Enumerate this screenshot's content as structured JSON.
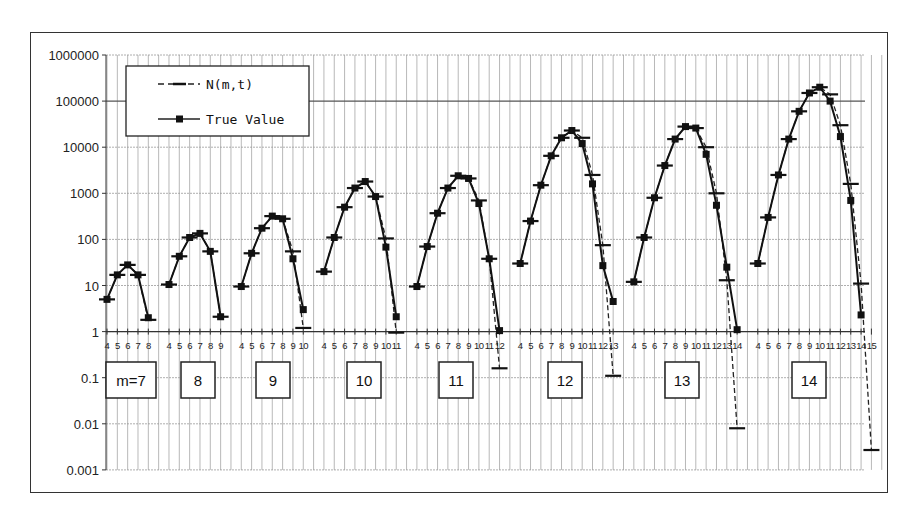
{
  "chart_data": {
    "type": "line",
    "title": "",
    "xlabel": "t (grouped by m)",
    "ylabel": "",
    "yscale": "log",
    "ylim": [
      0.001,
      1000000
    ],
    "y_ticks": [
      "1000000",
      "100000",
      "10000",
      "1000",
      "100",
      "10",
      "1",
      "0.1",
      "0.01",
      "0.001"
    ],
    "grid": true,
    "legend": {
      "position": "upper-left",
      "entries": [
        {
          "label": "N(m,t)",
          "style": "dashed",
          "marker": "dash"
        },
        {
          "label": "True Value",
          "style": "solid",
          "marker": "square"
        }
      ]
    },
    "group_labels": [
      "m=7",
      "8",
      "9",
      "10",
      "11",
      "12",
      "13",
      "14"
    ],
    "groups": [
      {
        "m": 7,
        "t": [
          4,
          5,
          6,
          7,
          8
        ],
        "N": [
          5,
          17,
          28,
          17,
          1.8
        ],
        "true": [
          5,
          17,
          28,
          17,
          2
        ]
      },
      {
        "m": 8,
        "t": [
          4,
          5,
          6,
          7,
          8,
          9
        ],
        "N": [
          10.5,
          43,
          110,
          135,
          55,
          2.1
        ],
        "true": [
          10.5,
          43,
          110,
          135,
          55,
          2.1
        ]
      },
      {
        "m": 9,
        "t": [
          4,
          5,
          6,
          7,
          8,
          9,
          10
        ],
        "N": [
          9.5,
          50,
          175,
          320,
          280,
          55,
          1.2
        ],
        "true": [
          9.5,
          50,
          175,
          320,
          280,
          38,
          3
        ]
      },
      {
        "m": 10,
        "t": [
          4,
          5,
          6,
          7,
          8,
          9,
          10,
          11
        ],
        "N": [
          20,
          110,
          500,
          1300,
          1800,
          850,
          105,
          0.95
        ],
        "true": [
          20,
          110,
          500,
          1300,
          1800,
          850,
          68,
          2.1
        ]
      },
      {
        "m": 11,
        "t": [
          4,
          5,
          6,
          7,
          8,
          9,
          10,
          11,
          12
        ],
        "N": [
          9.5,
          70,
          370,
          1300,
          2400,
          2100,
          700,
          38,
          0.16
        ],
        "true": [
          9.5,
          70,
          370,
          1300,
          2400,
          2100,
          600,
          38,
          1.05
        ]
      },
      {
        "m": 12,
        "t": [
          4,
          5,
          6,
          7,
          8,
          9,
          10,
          11,
          12,
          13
        ],
        "N": [
          30,
          250,
          1500,
          6500,
          16000,
          23000,
          16000,
          2500,
          75,
          0.11
        ],
        "true": [
          30,
          250,
          1500,
          6500,
          16000,
          23000,
          12000,
          1600,
          27,
          4.5
        ]
      },
      {
        "m": 13,
        "t": [
          4,
          5,
          6,
          7,
          8,
          9,
          10,
          11,
          12,
          13,
          14
        ],
        "N": [
          12,
          110,
          800,
          4000,
          15000,
          28000,
          26000,
          10000,
          1000,
          13,
          0.008
        ],
        "true": [
          12,
          110,
          800,
          4000,
          15000,
          28000,
          26000,
          7000,
          550,
          25,
          1.1
        ]
      },
      {
        "m": 14,
        "t": [
          4,
          5,
          6,
          7,
          8,
          9,
          10,
          11,
          12,
          13,
          14,
          15
        ],
        "N": [
          30,
          300,
          2500,
          15000,
          60000,
          150000,
          200000,
          140000,
          30000,
          1600,
          11,
          0.0027
        ],
        "true": [
          30,
          300,
          2500,
          15000,
          60000,
          150000,
          200000,
          100000,
          17000,
          700,
          2.3,
          null
        ]
      }
    ]
  }
}
